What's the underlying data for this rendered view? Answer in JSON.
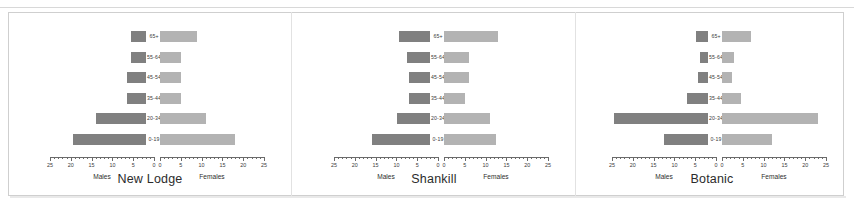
{
  "figure": {
    "axis_ticks": [
      0,
      5,
      10,
      15,
      20,
      25
    ],
    "male_series_label": "Males",
    "female_series_label": "Females"
  },
  "chart_data": {
    "type": "bar",
    "subtype": "population-pyramid",
    "title": "",
    "xlabel": "",
    "ylabel": "",
    "xlim": [
      0,
      25
    ],
    "grid": false,
    "legend": "none",
    "categories": [
      "0-19",
      "20-34",
      "35-44",
      "45-54",
      "55-64",
      "65+"
    ],
    "category_order": "bottom-to-top",
    "colors": {
      "males": "#808080",
      "females": "#b3b3b3",
      "axis": "#6a6a6a",
      "text": "#2e2e2e",
      "frame": "#cfcfcf"
    },
    "panels": [
      {
        "name": "New Lodge",
        "axis_label_left": "Males",
        "axis_label_right": "Females",
        "series": [
          {
            "name": "Males",
            "values": [
              17.5,
              12.0,
              4.5,
              4.5,
              3.5,
              3.5
            ]
          },
          {
            "name": "Females",
            "values": [
              18.0,
              11.0,
              5.0,
              5.0,
              5.0,
              9.0
            ]
          }
        ]
      },
      {
        "name": "Shankill",
        "axis_label_left": "Males",
        "axis_label_right": "Females",
        "series": [
          {
            "name": "Males",
            "values": [
              14.0,
              8.0,
              5.0,
              5.0,
              5.5,
              7.5
            ]
          },
          {
            "name": "Females",
            "values": [
              12.5,
              11.0,
              5.0,
              6.0,
              6.0,
              13.0
            ]
          }
        ]
      },
      {
        "name": "Botanic",
        "axis_label_left": "Males",
        "axis_label_right": "Females",
        "series": [
          {
            "name": "Males",
            "values": [
              10.5,
              22.5,
              5.0,
              2.5,
              2.0,
              3.0
            ]
          },
          {
            "name": "Females",
            "values": [
              12.0,
              23.0,
              4.5,
              2.5,
              3.0,
              7.0
            ]
          }
        ]
      }
    ]
  }
}
